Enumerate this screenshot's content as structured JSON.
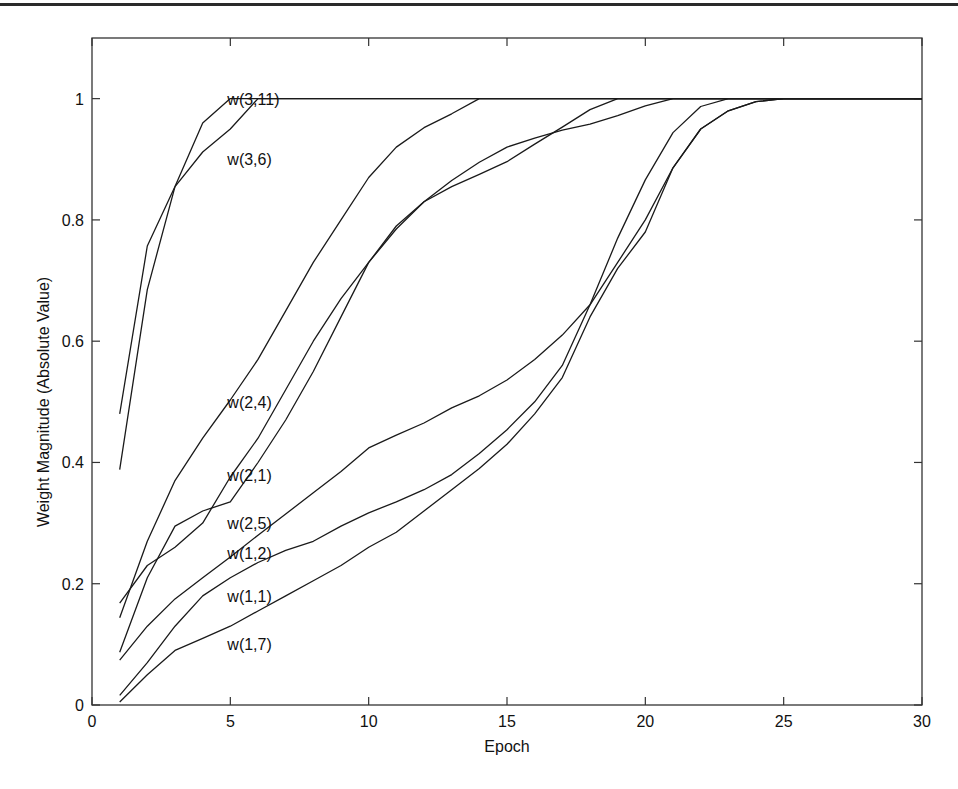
{
  "page": {
    "header_rule": true
  },
  "chart_data": {
    "type": "line",
    "title": "",
    "xlabel": "Epoch",
    "ylabel": "Weight Magnitude (Absolute Value)",
    "xlim": [
      0,
      30
    ],
    "ylim": [
      0,
      1.1
    ],
    "xticks": [
      0,
      5,
      10,
      15,
      20,
      25,
      30
    ],
    "yticks": [
      0,
      0.2,
      0.4,
      0.6,
      0.8,
      1
    ],
    "ytick_labels": [
      "0",
      "0.2",
      "0.4",
      "0.6",
      "0.8",
      "1"
    ],
    "xtick_labels": [
      "0",
      "5",
      "10",
      "15",
      "20",
      "25",
      "30"
    ],
    "grid": false,
    "legend": "inline labels near x=5",
    "line_color": "#1a1a1a",
    "x": [
      1,
      2,
      3,
      4,
      5,
      6,
      7,
      8,
      9,
      10,
      11,
      12,
      13,
      14,
      15,
      16,
      17,
      18,
      19,
      20,
      21,
      22,
      23,
      24,
      25,
      26,
      27,
      28,
      29,
      30
    ],
    "series": [
      {
        "name": "w(3,11)",
        "label_pos": [
          5,
          1.0
        ],
        "values": [
          0.48,
          0.757,
          0.855,
          0.96,
          1.0,
          1.0,
          1.0,
          1.0,
          1.0,
          1.0,
          1.0,
          1.0,
          1.0,
          1.0,
          1.0,
          1.0,
          1.0,
          1.0,
          1.0,
          1.0,
          1.0,
          1.0,
          1.0,
          1.0,
          1.0,
          1.0,
          1.0,
          1.0,
          1.0,
          1.0
        ]
      },
      {
        "name": "w(3,6)",
        "label_pos": [
          5,
          0.9
        ],
        "values": [
          0.388,
          0.685,
          0.855,
          0.912,
          0.95,
          1.0,
          1.0,
          1.0,
          1.0,
          1.0,
          1.0,
          1.0,
          1.0,
          1.0,
          1.0,
          1.0,
          1.0,
          1.0,
          1.0,
          1.0,
          1.0,
          1.0,
          1.0,
          1.0,
          1.0,
          1.0,
          1.0,
          1.0,
          1.0,
          1.0
        ]
      },
      {
        "name": "w(2,4)",
        "label_pos": [
          5,
          0.5
        ],
        "values": [
          0.144,
          0.27,
          0.37,
          0.44,
          0.503,
          0.57,
          0.65,
          0.73,
          0.8,
          0.87,
          0.92,
          0.952,
          0.975,
          1.0,
          1.0,
          1.0,
          1.0,
          1.0,
          1.0,
          1.0,
          1.0,
          1.0,
          1.0,
          1.0,
          1.0,
          1.0,
          1.0,
          1.0,
          1.0,
          1.0
        ]
      },
      {
        "name": "w(2,1)",
        "label_pos": [
          5,
          0.38
        ],
        "values": [
          0.168,
          0.23,
          0.26,
          0.3,
          0.376,
          0.44,
          0.52,
          0.6,
          0.67,
          0.73,
          0.785,
          0.83,
          0.865,
          0.895,
          0.92,
          0.935,
          0.948,
          0.958,
          0.972,
          0.988,
          1.0,
          1.0,
          1.0,
          1.0,
          1.0,
          1.0,
          1.0,
          1.0,
          1.0,
          1.0
        ]
      },
      {
        "name": "w(2,5)",
        "label_pos": [
          5,
          0.3
        ],
        "values": [
          0.087,
          0.21,
          0.295,
          0.32,
          0.335,
          0.4,
          0.47,
          0.55,
          0.64,
          0.73,
          0.79,
          0.83,
          0.855,
          0.875,
          0.896,
          0.925,
          0.953,
          0.982,
          1.0,
          1.0,
          1.0,
          1.0,
          1.0,
          1.0,
          1.0,
          1.0,
          1.0,
          1.0,
          1.0,
          1.0
        ]
      },
      {
        "name": "w(1,2)",
        "label_pos": [
          5,
          0.25
        ],
        "values": [
          0.074,
          0.13,
          0.175,
          0.21,
          0.244,
          0.28,
          0.315,
          0.35,
          0.385,
          0.424,
          0.445,
          0.465,
          0.49,
          0.51,
          0.536,
          0.57,
          0.61,
          0.66,
          0.73,
          0.8,
          0.886,
          0.95,
          0.98,
          0.995,
          1.0,
          1.0,
          1.0,
          1.0,
          1.0,
          1.0
        ]
      },
      {
        "name": "w(1,1)",
        "label_pos": [
          5,
          0.18
        ],
        "values": [
          0.016,
          0.07,
          0.13,
          0.18,
          0.21,
          0.235,
          0.255,
          0.27,
          0.295,
          0.317,
          0.335,
          0.355,
          0.38,
          0.415,
          0.454,
          0.5,
          0.56,
          0.66,
          0.77,
          0.866,
          0.944,
          0.987,
          1.0,
          1.0,
          1.0,
          1.0,
          1.0,
          1.0,
          1.0,
          1.0
        ]
      },
      {
        "name": "w(1,7)",
        "label_pos": [
          5,
          0.1
        ],
        "values": [
          0.005,
          0.05,
          0.09,
          0.11,
          0.13,
          0.155,
          0.18,
          0.205,
          0.23,
          0.26,
          0.285,
          0.32,
          0.355,
          0.39,
          0.43,
          0.48,
          0.54,
          0.64,
          0.72,
          0.78,
          0.886,
          0.95,
          0.98,
          0.995,
          1.0,
          1.0,
          1.0,
          1.0,
          1.0,
          1.0
        ]
      }
    ]
  }
}
